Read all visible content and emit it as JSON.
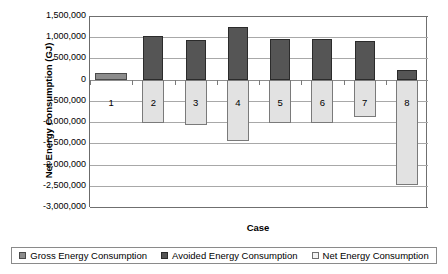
{
  "chart_data": {
    "type": "bar",
    "title": "",
    "xlabel": "Case",
    "ylabel": "Net Energy Consumption (GJ)",
    "categories": [
      "1",
      "2",
      "3",
      "4",
      "5",
      "6",
      "7",
      "8"
    ],
    "ylim": [
      -3000000,
      1500000
    ],
    "ytick_labels": [
      "1,500,000",
      "1,000,000",
      "500,000",
      "0",
      "-500,000",
      "-1,000,000",
      "-1,500,000",
      "-2,000,000",
      "-2,500,000",
      "-3,000,000"
    ],
    "ytick_values": [
      1500000,
      1000000,
      500000,
      0,
      -500000,
      -1000000,
      -1500000,
      -2000000,
      -2500000,
      -3000000
    ],
    "grid": true,
    "legend_position": "bottom",
    "series": [
      {
        "name": "Gross Energy Consumption",
        "color": "#8c8c8c",
        "values": [
          160000,
          0,
          0,
          0,
          0,
          0,
          0,
          0
        ]
      },
      {
        "name": "Avoided Energy Consumption",
        "color": "#555555",
        "values": [
          0,
          1020000,
          930000,
          1230000,
          960000,
          960000,
          900000,
          230000
        ]
      },
      {
        "name": "Net Energy Consumption",
        "color": "#e2e2e2",
        "values": [
          0,
          -1020000,
          -1080000,
          -1450000,
          -1030000,
          -1030000,
          -880000,
          -2480000
        ]
      }
    ]
  },
  "legend": {
    "items": [
      {
        "label": "Gross Energy Consumption",
        "swatch": "gross-swatch"
      },
      {
        "label": "Avoided Energy Consumption",
        "swatch": "avoided-swatch"
      },
      {
        "label": "Net Energy Consumption",
        "swatch": "net-swatch"
      }
    ]
  }
}
